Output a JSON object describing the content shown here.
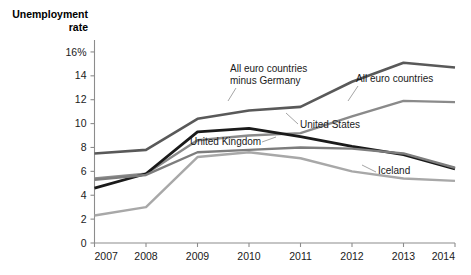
{
  "chart_data": {
    "type": "line",
    "title": "",
    "ylabel": "Unemployment rate",
    "xlabel": "",
    "ylim": [
      0,
      17
    ],
    "xlim": [
      2007,
      2014
    ],
    "grid": false,
    "legend_position": "inline-labels",
    "ytick_labels": [
      "0",
      "2",
      "4",
      "6",
      "8",
      "10",
      "12",
      "14",
      "16%"
    ],
    "ytick_values": [
      0,
      2,
      4,
      6,
      8,
      10,
      12,
      14,
      16
    ],
    "x": [
      2007,
      2008,
      2009,
      2010,
      2011,
      2012,
      2013,
      2014
    ],
    "xtick_labels": [
      "2007",
      "2008",
      "2009",
      "2010",
      "2011",
      "2012",
      "2013",
      "2014"
    ],
    "series": [
      {
        "name": "All euro countries minus Germany",
        "label": "All euro countries\nminus Germany",
        "label_line1": "All euro countries",
        "label_line2": "minus Germany",
        "color": "#595959",
        "width": 2.6,
        "values": [
          7.5,
          7.8,
          10.4,
          11.1,
          11.4,
          13.5,
          15.1,
          14.7
        ]
      },
      {
        "name": "All euro countries",
        "label": "All euro countries",
        "color": "#8a8a8a",
        "width": 2.4,
        "values": [
          5.4,
          5.8,
          8.6,
          9.0,
          9.2,
          10.6,
          11.9,
          11.8
        ]
      },
      {
        "name": "United States",
        "label": "United States",
        "color": "#1a1a1a",
        "width": 2.8,
        "values": [
          4.6,
          5.8,
          9.3,
          9.6,
          8.9,
          8.1,
          7.4,
          6.2
        ]
      },
      {
        "name": "United Kingdom",
        "label": "United Kingdom",
        "color": "#7d7d7d",
        "width": 2.4,
        "values": [
          5.3,
          5.7,
          7.6,
          7.8,
          8.0,
          7.9,
          7.5,
          6.3
        ]
      },
      {
        "name": "Iceland",
        "label": "Iceland",
        "color": "#a8a8a8",
        "width": 2.4,
        "values": [
          2.3,
          3.0,
          7.2,
          7.6,
          7.1,
          6.0,
          5.4,
          5.2
        ]
      }
    ],
    "annotations": [
      {
        "name": "label-euro-minus-germany",
        "text": "All euro countries minus Germany"
      },
      {
        "name": "label-all-euro-countries",
        "text": "All euro countries"
      },
      {
        "name": "label-united-states",
        "text": "United States"
      },
      {
        "name": "label-united-kingdom",
        "text": "United Kingdom"
      },
      {
        "name": "label-iceland",
        "text": "Iceland"
      }
    ]
  },
  "axis": {
    "ylabel_line1": "Unemployment",
    "ylabel_line2": "rate"
  }
}
